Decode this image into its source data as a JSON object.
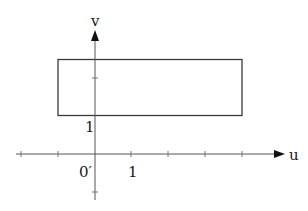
{
  "diagram": {
    "type": "coordinate-plane-region",
    "axes": {
      "x_label": "u",
      "y_label": "v",
      "origin_label": "0′",
      "x_tick_label": "1",
      "y_tick_label": "1"
    },
    "region": {
      "shape": "rectangle",
      "u_range": [
        -1,
        4
      ],
      "v_range": [
        1,
        2.5
      ]
    },
    "colors": {
      "line": "#333333",
      "background": "#ffffff"
    }
  }
}
